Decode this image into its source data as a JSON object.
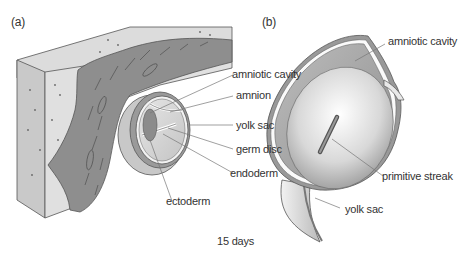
{
  "panels": {
    "a": {
      "tag": "(a)",
      "labels": {
        "amniotic_cavity": "amniotic cavity",
        "amnion": "amnion",
        "yolk_sac": "yolk sac",
        "germ_disc": "germ disc",
        "endoderm": "endoderm",
        "ectoderm": "ectoderm"
      }
    },
    "b": {
      "tag": "(b)",
      "labels": {
        "amniotic_cavity": "amniotic cavity",
        "primitive_streak": "primitive streak",
        "yolk_sac": "yolk sac"
      }
    }
  },
  "caption": "15 days",
  "colors": {
    "tissue_dark": "#8a8a8a",
    "tissue_light": "#d6d6d6",
    "outline": "#555555",
    "label_text": "#333333",
    "leader_line": "#777777"
  }
}
